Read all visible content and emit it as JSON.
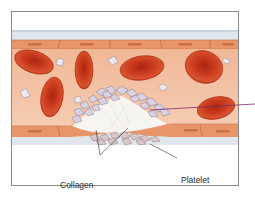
{
  "figure": {
    "labels": {
      "collagen": {
        "line1": "Collagen",
        "line2": "fibers"
      },
      "platelet_plug": {
        "line1": "Platelet",
        "line2": "plug"
      }
    },
    "colors": {
      "frame": "#8a8a8a",
      "vessel_outer": "#dfe6ee",
      "endothelium": "#e8956a",
      "lumen": "#f2c2a4",
      "red_blood_cell": "#c8331c",
      "platelet": "#d7d1e0",
      "pointer_line": "#7a2a6a"
    }
  }
}
